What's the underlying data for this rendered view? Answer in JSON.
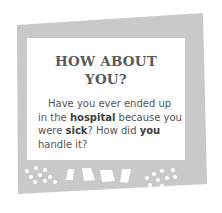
{
  "card": {
    "title_line1": "HOW ABOUT",
    "title_line2": "YOU?",
    "body": {
      "line1": "Have you ever ended up",
      "line2_pre": "in the ",
      "line2_bold": "hospital",
      "line2_post": " because you",
      "line3_pre": "were ",
      "line3_bold1": "sick",
      "line3_mid": "? How did ",
      "line3_bold2": "you",
      "line4": "handle it?"
    }
  },
  "colors": {
    "frame": "#c9c9c9",
    "panel": "#ffffff",
    "title": "#5a5a5a",
    "text": "#555555"
  }
}
